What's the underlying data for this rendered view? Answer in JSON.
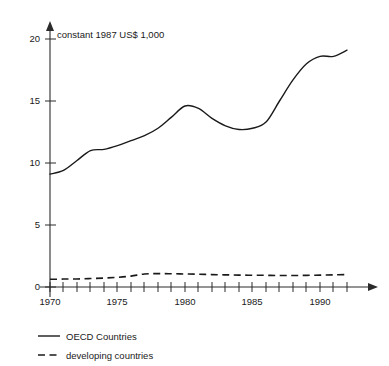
{
  "chart_data": {
    "type": "line",
    "title": "",
    "subtitle": "",
    "xlabel": "",
    "ylabel": "constant 1987 US$ 1,000",
    "axis_note": "constant 1987 US$ 1,000",
    "xlim": [
      1969.5,
      1992.2
    ],
    "ylim": [
      0,
      21
    ],
    "grid": false,
    "legend_position": "below-left",
    "y_ticks": [
      0,
      5,
      10,
      15,
      20
    ],
    "y_ticklabels": [
      "0",
      "5",
      "10",
      "15",
      "20"
    ],
    "x_ticks": [
      1970,
      1971,
      1972,
      1973,
      1974,
      1975,
      1976,
      1977,
      1978,
      1979,
      1980,
      1981,
      1982,
      1983,
      1984,
      1985,
      1986,
      1987,
      1988,
      1989,
      1990,
      1991,
      1992
    ],
    "x_ticklabels_shown": [
      "1970",
      "1975",
      "1980",
      "1985",
      "1990"
    ],
    "x_ticklabel_years": [
      1970,
      1975,
      1980,
      1985,
      1990
    ],
    "x": [
      1970,
      1971,
      1972,
      1973,
      1974,
      1975,
      1976,
      1977,
      1978,
      1979,
      1980,
      1981,
      1982,
      1983,
      1984,
      1985,
      1986,
      1987,
      1988,
      1989,
      1990,
      1991,
      1992
    ],
    "series": [
      {
        "name": "OECD Countries",
        "style": "solid",
        "color": "#1a1a1a",
        "values": [
          9.1,
          9.4,
          10.2,
          11.0,
          11.1,
          11.4,
          11.8,
          12.2,
          12.8,
          13.7,
          14.6,
          14.4,
          13.6,
          13.0,
          12.7,
          12.8,
          13.3,
          15.0,
          16.7,
          18.0,
          18.6,
          18.6,
          19.1
        ]
      },
      {
        "name": "developing countries",
        "style": "dashed",
        "color": "#1a1a1a",
        "values": [
          0.62,
          0.64,
          0.65,
          0.68,
          0.72,
          0.78,
          0.88,
          1.05,
          1.08,
          1.07,
          1.05,
          1.03,
          1.0,
          0.98,
          0.96,
          0.95,
          0.94,
          0.93,
          0.93,
          0.94,
          0.96,
          0.98,
          1.0
        ]
      }
    ],
    "legend": [
      {
        "label": "OECD Countries",
        "style": "solid"
      },
      {
        "label": "developing countries",
        "style": "dashed"
      }
    ],
    "colors": {
      "background": "#ffffff",
      "axis": "#2b2b2b",
      "text": "#1a1a1a",
      "line": "#1a1a1a"
    }
  }
}
